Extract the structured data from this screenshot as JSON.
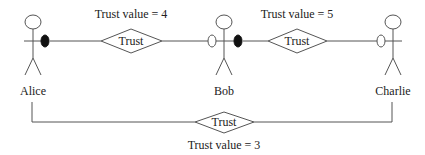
{
  "actors": [
    {
      "name": "Alice"
    },
    {
      "name": "Bob"
    },
    {
      "name": "Charlie"
    }
  ],
  "relations": [
    {
      "from": "Alice",
      "to": "Bob",
      "label": "Trust",
      "value_text": "Trust value = 4"
    },
    {
      "from": "Bob",
      "to": "Charlie",
      "label": "Trust",
      "value_text": "Trust value = 5"
    },
    {
      "from": "Alice",
      "to": "Charlie",
      "label": "Trust",
      "value_text": "Trust value = 3"
    }
  ],
  "colors": {
    "line": "#555555",
    "filled_port": "#111111"
  }
}
